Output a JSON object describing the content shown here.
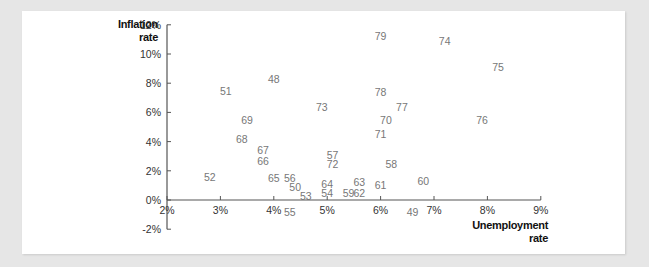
{
  "chart_data": {
    "type": "scatter",
    "title": "",
    "xlabel": "Unemployment rate",
    "ylabel": "Inflation rate",
    "xlim": [
      2,
      9
    ],
    "ylim": [
      -2,
      12
    ],
    "x_ticks": [
      "2%",
      "3%",
      "4%",
      "5%",
      "6%",
      "7%",
      "8%",
      "9%"
    ],
    "y_ticks": [
      "12%",
      "10%",
      "8%",
      "6%",
      "4%",
      "2%",
      "0%",
      "-2%"
    ],
    "grid": false,
    "legend": null,
    "point_style": "year labels (19xx) plotted as text",
    "points": [
      {
        "label": "48",
        "x": 4.0,
        "y": 8.3
      },
      {
        "label": "49",
        "x": 6.6,
        "y": -0.8
      },
      {
        "label": "50",
        "x": 4.4,
        "y": 0.9
      },
      {
        "label": "51",
        "x": 3.1,
        "y": 7.5
      },
      {
        "label": "52",
        "x": 2.8,
        "y": 1.6
      },
      {
        "label": "53",
        "x": 4.6,
        "y": 0.3
      },
      {
        "label": "54",
        "x": 5.0,
        "y": 0.5
      },
      {
        "label": "55",
        "x": 4.3,
        "y": -0.8
      },
      {
        "label": "56",
        "x": 4.3,
        "y": 1.5
      },
      {
        "label": "57",
        "x": 5.1,
        "y": 3.1
      },
      {
        "label": "58",
        "x": 6.2,
        "y": 2.5
      },
      {
        "label": "59",
        "x": 5.4,
        "y": 0.5
      },
      {
        "label": "60",
        "x": 6.8,
        "y": 1.3
      },
      {
        "label": "61",
        "x": 6.0,
        "y": 1.0
      },
      {
        "label": "62",
        "x": 5.6,
        "y": 0.5
      },
      {
        "label": "63",
        "x": 5.6,
        "y": 1.2
      },
      {
        "label": "64",
        "x": 5.0,
        "y": 1.1
      },
      {
        "label": "65",
        "x": 4.0,
        "y": 1.5
      },
      {
        "label": "66",
        "x": 3.8,
        "y": 2.7
      },
      {
        "label": "67",
        "x": 3.8,
        "y": 3.4
      },
      {
        "label": "68",
        "x": 3.4,
        "y": 4.2
      },
      {
        "label": "69",
        "x": 3.5,
        "y": 5.5
      },
      {
        "label": "70",
        "x": 6.1,
        "y": 5.5
      },
      {
        "label": "71",
        "x": 6.0,
        "y": 4.5
      },
      {
        "label": "72",
        "x": 5.1,
        "y": 2.5
      },
      {
        "label": "73",
        "x": 4.9,
        "y": 6.4
      },
      {
        "label": "74",
        "x": 7.2,
        "y": 10.9
      },
      {
        "label": "75",
        "x": 8.2,
        "y": 9.1
      },
      {
        "label": "76",
        "x": 7.9,
        "y": 5.5
      },
      {
        "label": "77",
        "x": 6.4,
        "y": 6.4
      },
      {
        "label": "78",
        "x": 6.0,
        "y": 7.4
      },
      {
        "label": "79",
        "x": 6.0,
        "y": 11.2
      }
    ],
    "colors": {
      "axis": "#555555",
      "tick_label": "#333333",
      "point_label": "#777777",
      "title": "#111111"
    }
  },
  "axis_titles": {
    "y_line1": "Inflation",
    "y_line2": "rate",
    "x_line1": "Unemployment",
    "x_line2": "rate"
  }
}
